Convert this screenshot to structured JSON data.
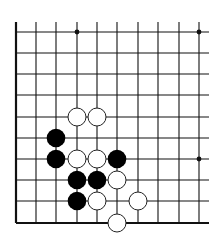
{
  "diagram": {
    "type": "go-board-fragment",
    "columns": 10,
    "rows": 10,
    "grid": {
      "x": [
        16,
        36,
        56,
        77,
        97,
        117,
        138,
        158,
        179,
        199
      ],
      "y": [
        32,
        53,
        74,
        95,
        117,
        138,
        159,
        180,
        201,
        223
      ],
      "line_top": 22,
      "line_right": 209,
      "left_edge": true,
      "bottom_edge": true
    },
    "star_points": [
      [
        3,
        0
      ],
      [
        9,
        0
      ],
      [
        9,
        6
      ]
    ],
    "stones": {
      "white": [
        [
          3,
          4
        ],
        [
          4,
          4
        ],
        [
          3,
          6
        ],
        [
          4,
          6
        ],
        [
          5,
          7
        ],
        [
          4,
          8
        ],
        [
          6,
          8
        ],
        [
          5,
          9
        ]
      ],
      "black": [
        [
          2,
          5
        ],
        [
          2,
          6
        ],
        [
          5,
          6
        ],
        [
          3,
          7
        ],
        [
          4,
          7
        ],
        [
          3,
          8
        ]
      ]
    },
    "colors": {
      "line": "#111111",
      "black_stone": "#000000",
      "white_stone": "#ffffff",
      "white_stone_outline": "#222222",
      "background": "#ffffff"
    }
  }
}
